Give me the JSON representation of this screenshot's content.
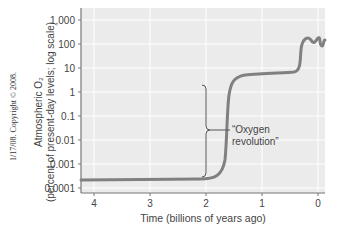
{
  "chart_data": {
    "type": "line",
    "title": "",
    "xlabel": "Time (billions of years ago)",
    "ylabel_line1": "Atmospheric O2",
    "ylabel_line2": "(percent of present-day levels; log scale)",
    "x_ticks": [
      "4",
      "3",
      "2",
      "1",
      "0"
    ],
    "y_ticks": [
      "1,000",
      "100",
      "10",
      "1",
      "0.1",
      "0.01",
      "0.001",
      "0.0001"
    ],
    "xlim": [
      4.2,
      0
    ],
    "ylim": [
      7e-05,
      2000
    ],
    "y_scale": "log",
    "grid": true,
    "series": [
      {
        "name": "Atmospheric O2",
        "x": [
          4.2,
          3.5,
          3.0,
          2.6,
          2.45,
          2.35,
          2.3,
          2.25,
          2.2,
          2.1,
          1.9,
          1.5,
          1.0,
          0.8,
          0.65,
          0.6,
          0.55,
          0.45,
          0.35,
          0.25,
          0.15,
          0.05
        ],
        "y": [
          0.0002,
          0.0002,
          0.0002,
          0.00025,
          0.0006,
          0.005,
          0.5,
          3,
          5,
          6,
          7,
          8,
          8,
          8,
          10,
          50,
          120,
          80,
          110,
          80,
          110,
          100
        ]
      }
    ],
    "annotations": [
      {
        "text": "“Oxygen revolution”",
        "x_range": [
          2.3,
          2.3
        ],
        "y_range": [
          0.0004,
          5
        ],
        "type": "bracket"
      }
    ]
  },
  "labels": {
    "copyright": "1/17/08. Copyright © 2008.",
    "ylabel_main": "Atmospheric O₂",
    "ylabel_sub": "(percent of present-day levels; log scale)",
    "xlabel": "Time (billions of years ago)",
    "annotation_line1": "“Oxygen",
    "annotation_line2": "revolution”"
  },
  "colors": {
    "plot_bg": "#ebebeb",
    "grid": "#ffffff",
    "curve": "#808080",
    "axis": "#777777"
  }
}
